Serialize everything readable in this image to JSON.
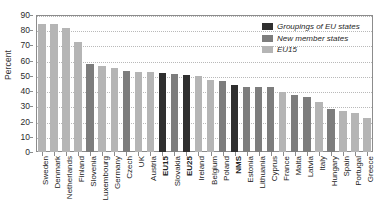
{
  "chart_data": {
    "type": "bar",
    "title": "",
    "subtitle": "",
    "xlabel": "",
    "ylabel": "Percent",
    "ylim": [
      0,
      90
    ],
    "ytick_step": 10,
    "yticks": [
      0,
      10,
      20,
      30,
      40,
      50,
      60,
      70,
      80,
      90
    ],
    "grid": true,
    "grid_style": "horizontal dotted",
    "legend_position": "top-right",
    "categories": [
      "Sweden",
      "Denmark",
      "Netherlands",
      "Finland",
      "Slovenia",
      "Luxembourg",
      "Germany",
      "Czech",
      "UK",
      "Austria",
      "EU15",
      "Slovakia",
      "EU25",
      "Ireland",
      "Belgium",
      "Poland",
      "NMS",
      "Estonia",
      "Lithuania",
      "Cyprus",
      "France",
      "Malta",
      "Latvia",
      "Italy",
      "Hungary",
      "Spain",
      "Portugal",
      "Greece"
    ],
    "values": [
      84.0,
      84.0,
      81.5,
      72.0,
      58.0,
      56.5,
      55.5,
      53.5,
      52.5,
      52.5,
      52.0,
      51.5,
      50.5,
      50.0,
      47.5,
      46.5,
      44.0,
      43.0,
      43.0,
      42.5,
      39.5,
      37.5,
      36.0,
      33.0,
      28.5,
      27.0,
      25.5,
      22.5
    ],
    "groups": [
      "eu15",
      "eu15",
      "eu15",
      "eu15",
      "new",
      "eu15",
      "eu15",
      "new",
      "eu15",
      "eu15",
      "grp",
      "new",
      "grp",
      "eu15",
      "eu15",
      "new",
      "grp",
      "new",
      "new",
      "new",
      "eu15",
      "new",
      "new",
      "eu15",
      "new",
      "eu15",
      "eu15",
      "eu15"
    ],
    "bold_categories": [
      "EU15",
      "EU25",
      "NMS"
    ],
    "legend": [
      {
        "key": "grp",
        "label": "Groupings of EU states",
        "color": "#2f2f2f"
      },
      {
        "key": "new",
        "label": "New member states",
        "color": "#7d7d7d"
      },
      {
        "key": "eu15",
        "label": "EU15",
        "color": "#b5b5b5"
      }
    ]
  },
  "colors": {
    "groupings": "#2f2f2f",
    "new_member_states": "#7d7d7d",
    "eu15": "#b5b5b5",
    "axis": "#8c8c8c",
    "grid": "#b9b9b9",
    "text": "#222222",
    "background": "#ffffff"
  }
}
